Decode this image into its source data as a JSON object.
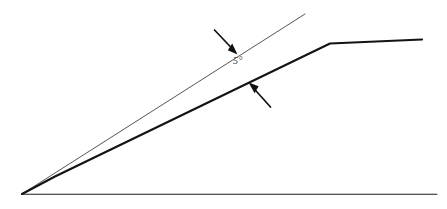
{
  "figure": {
    "kind": "technical-line-drawing",
    "background_color": "#ffffff",
    "ink_color": "#1a1a1a",
    "thin_line_color": "#4a4a4a",
    "label_color": "#3a3a3a"
  },
  "annotations": {
    "angle_label": "5°",
    "angle_value": 5,
    "angle_units": "degrees"
  },
  "geometry": {
    "vertex": {
      "x": 22,
      "y": 194
    },
    "baseline": {
      "x1": 22,
      "y1": 194,
      "x2": 437,
      "y2": 194
    },
    "upper_thin_line": {
      "x1": 22,
      "y1": 194,
      "x2": 305,
      "y2": 14
    },
    "lower_thick_line_points": "22,194 55,176 330,43 422,39",
    "bend_point": {
      "x": 330,
      "y": 43
    },
    "upper_arrow": {
      "tail_x": 214,
      "tail_y": 30,
      "tip_x": 236,
      "tip_y": 53
    },
    "lower_arrow": {
      "tail_x": 270,
      "tail_y": 107,
      "tip_x": 249,
      "tip_y": 83
    },
    "label_position": {
      "x": 233,
      "y": 58
    }
  }
}
